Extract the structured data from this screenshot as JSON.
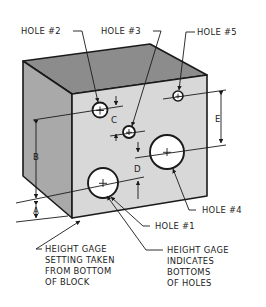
{
  "colors": {
    "top_face": "#8c8c8c",
    "left_face": "#a9a9a9",
    "front_face": "#d8d8d8",
    "hole_fill": "#ffffff",
    "line": "#1a1a1a"
  },
  "labels": {
    "hole_1": "HOLE #1",
    "hole_2": "HOLE #2",
    "hole_3": "HOLE #3",
    "hole_4": "HOLE #4",
    "hole_5": "HOLE #5"
  },
  "dimensions": {
    "a": "A",
    "b": "B",
    "c": "C",
    "d": "D",
    "e": "E"
  },
  "callouts": {
    "setting_lines": [
      "HEIGHT GAGE",
      "SETTING TAKEN",
      "FROM BOTTOM",
      "OF BLOCK"
    ],
    "indicates_lines": [
      "HEIGHT GAGE",
      "INDICATES",
      "BOTTOMS",
      "OF HOLES"
    ]
  }
}
